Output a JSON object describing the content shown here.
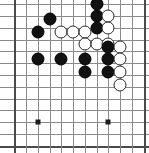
{
  "figure": {
    "type": "go-board-diagram",
    "board_size": 19,
    "visible_region": "bottom-left portion of board, cropped",
    "colors": {
      "background": "#ffffff",
      "grid_line": "#8a8a8a",
      "edge_line": "#4a4a4a",
      "black_stone": "#111111",
      "white_stone": "#ffffff",
      "white_stone_border": "#2b2b2b",
      "star_point": "#1a1a1a"
    }
  },
  "geometry": {
    "pitch_px": 11.7,
    "origin_x_px": 14,
    "origin_y_px": 4,
    "columns_px": [
      14,
      26,
      38,
      50,
      61,
      73,
      85,
      97,
      108,
      120,
      132,
      144
    ],
    "rows_px": [
      4,
      16,
      28,
      40,
      51,
      63,
      75,
      87,
      99,
      110,
      122,
      134,
      146
    ],
    "edges": {
      "left": true,
      "right": true,
      "bottom": true,
      "top": false
    }
  },
  "grid": {
    "horizontal_lines": [
      {
        "y": 4,
        "edge": false
      },
      {
        "y": 16,
        "edge": false
      },
      {
        "y": 28,
        "edge": false
      },
      {
        "y": 40,
        "edge": false
      },
      {
        "y": 51,
        "edge": false
      },
      {
        "y": 63,
        "edge": false
      },
      {
        "y": 75,
        "edge": false
      },
      {
        "y": 87,
        "edge": false
      },
      {
        "y": 99,
        "edge": false
      },
      {
        "y": 110,
        "edge": false
      },
      {
        "y": 122,
        "edge": false
      },
      {
        "y": 134,
        "edge": false
      },
      {
        "y": 146,
        "edge": true
      }
    ],
    "vertical_lines": [
      {
        "x": 14,
        "edge": true
      },
      {
        "x": 26,
        "edge": false
      },
      {
        "x": 38,
        "edge": false
      },
      {
        "x": 50,
        "edge": false
      },
      {
        "x": 61,
        "edge": false
      },
      {
        "x": 73,
        "edge": false
      },
      {
        "x": 85,
        "edge": false
      },
      {
        "x": 97,
        "edge": false
      },
      {
        "x": 108,
        "edge": false
      },
      {
        "x": 120,
        "edge": false
      },
      {
        "x": 132,
        "edge": false
      },
      {
        "x": 144,
        "edge": true
      }
    ]
  },
  "star_points": [
    {
      "x": 38,
      "y": 122
    },
    {
      "x": 108,
      "y": 122
    }
  ],
  "stones": [
    {
      "color": "black",
      "x": 97,
      "y": 4
    },
    {
      "color": "black",
      "x": 97,
      "y": 16
    },
    {
      "color": "white",
      "x": 108,
      "y": 16
    },
    {
      "color": "black",
      "x": 50,
      "y": 19
    },
    {
      "color": "black",
      "x": 97,
      "y": 28
    },
    {
      "color": "white",
      "x": 108,
      "y": 28
    },
    {
      "color": "black",
      "x": 38,
      "y": 32
    },
    {
      "color": "white",
      "x": 61,
      "y": 32
    },
    {
      "color": "white",
      "x": 73,
      "y": 32
    },
    {
      "color": "white",
      "x": 85,
      "y": 32
    },
    {
      "color": "white",
      "x": 85,
      "y": 44
    },
    {
      "color": "white",
      "x": 97,
      "y": 44
    },
    {
      "color": "white",
      "x": 108,
      "y": 44
    },
    {
      "color": "black",
      "x": 108,
      "y": 47
    },
    {
      "color": "white",
      "x": 120,
      "y": 47
    },
    {
      "color": "black",
      "x": 38,
      "y": 59
    },
    {
      "color": "black",
      "x": 61,
      "y": 59
    },
    {
      "color": "black",
      "x": 85,
      "y": 59
    },
    {
      "color": "black",
      "x": 108,
      "y": 59
    },
    {
      "color": "white",
      "x": 120,
      "y": 59
    },
    {
      "color": "black",
      "x": 85,
      "y": 72
    },
    {
      "color": "black",
      "x": 108,
      "y": 72
    },
    {
      "color": "white",
      "x": 120,
      "y": 72
    },
    {
      "color": "white",
      "x": 120,
      "y": 85
    }
  ],
  "counts": {
    "black_stones": 13,
    "white_stones": 11,
    "total_stones": 24
  }
}
